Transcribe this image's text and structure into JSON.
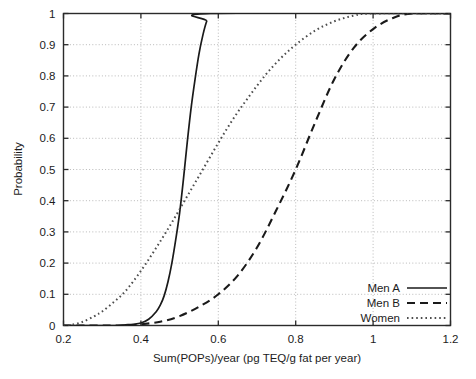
{
  "chart_data": {
    "type": "line",
    "title": "",
    "xlabel": "Sum(POPs)/year (pg TEQ/g fat per year)",
    "ylabel": "Probability",
    "xlim": [
      0.2,
      1.2
    ],
    "ylim": [
      0,
      1
    ],
    "xticks": [
      "0.2",
      "0.4",
      "0.6",
      "0.8",
      "1",
      "1.2"
    ],
    "xtick_values": [
      0.2,
      0.4,
      0.6,
      0.8,
      1.0,
      1.2
    ],
    "yticks": [
      "0",
      "0.1",
      "0.2",
      "0.3",
      "0.4",
      "0.5",
      "0.6",
      "0.7",
      "0.8",
      "0.9",
      "1"
    ],
    "ytick_values": [
      0,
      0.1,
      0.2,
      0.3,
      0.4,
      0.5,
      0.6,
      0.7,
      0.8,
      0.9,
      1.0
    ],
    "grid": true,
    "grid_style": "dotted",
    "legend_position": "bottom-right",
    "series": [
      {
        "name": "Men A",
        "style": "solid",
        "color": "#1a1a1a",
        "x": [
          0.2,
          0.3,
          0.34,
          0.36,
          0.38,
          0.4,
          0.42,
          0.44,
          0.45,
          0.46,
          0.47,
          0.48,
          0.49,
          0.5,
          0.51,
          0.52,
          0.53,
          0.54,
          0.55,
          0.56,
          0.57,
          0.58,
          1.2
        ],
        "y": [
          0.0,
          0.0,
          0.0,
          0.002,
          0.004,
          0.008,
          0.02,
          0.045,
          0.065,
          0.095,
          0.14,
          0.2,
          0.275,
          0.36,
          0.47,
          0.59,
          0.7,
          0.79,
          0.87,
          0.93,
          0.975,
          1.0,
          1.0
        ]
      },
      {
        "name": "Men B",
        "style": "dashed",
        "color": "#1a1a1a",
        "x": [
          0.2,
          0.36,
          0.4,
          0.45,
          0.5,
          0.55,
          0.6,
          0.65,
          0.7,
          0.75,
          0.8,
          0.85,
          0.9,
          0.95,
          1.0,
          1.05,
          1.1,
          1.2
        ],
        "y": [
          0.0,
          0.0,
          0.004,
          0.012,
          0.03,
          0.06,
          0.1,
          0.16,
          0.25,
          0.37,
          0.5,
          0.65,
          0.79,
          0.89,
          0.95,
          0.985,
          1.0,
          1.0
        ]
      },
      {
        "name": "Women",
        "style": "dotted",
        "color": "#4d4d4d",
        "x": [
          0.2,
          0.22,
          0.25,
          0.28,
          0.3,
          0.33,
          0.36,
          0.4,
          0.44,
          0.48,
          0.52,
          0.56,
          0.6,
          0.64,
          0.68,
          0.72,
          0.76,
          0.8,
          0.85,
          0.9,
          0.95,
          1.0,
          1.2
        ],
        "y": [
          0.0,
          0.002,
          0.012,
          0.03,
          0.045,
          0.075,
          0.11,
          0.175,
          0.25,
          0.33,
          0.415,
          0.5,
          0.585,
          0.665,
          0.735,
          0.8,
          0.855,
          0.9,
          0.945,
          0.975,
          0.993,
          1.0,
          1.0
        ]
      }
    ]
  },
  "legend": {
    "entries": [
      {
        "label": "Men A",
        "style": "solid"
      },
      {
        "label": "Men B",
        "style": "dashed"
      },
      {
        "label": "Women",
        "style": "dotted"
      }
    ]
  }
}
